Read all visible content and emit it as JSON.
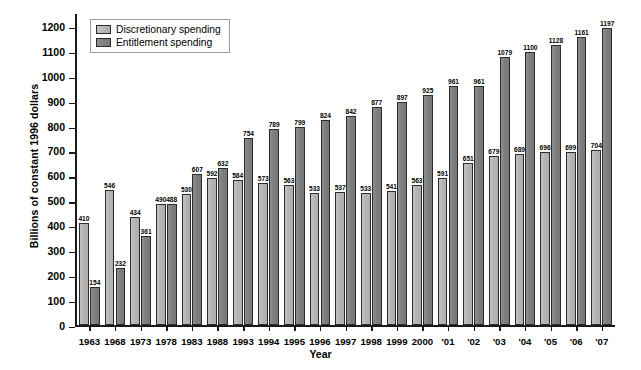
{
  "chart_data": {
    "type": "bar",
    "title": "",
    "xlabel": "Year",
    "ylabel": "Billions of constant 1996 dollars",
    "ylim": [
      0,
      1250
    ],
    "yticks": [
      0,
      100,
      200,
      300,
      400,
      500,
      600,
      700,
      800,
      900,
      1000,
      1100,
      1200
    ],
    "grid": false,
    "legend_position": "top-left",
    "categories": [
      "1963",
      "1968",
      "1973",
      "1978",
      "1983",
      "1988",
      "1993",
      "1994",
      "1995",
      "1996",
      "1997",
      "1998",
      "1999",
      "2000",
      "'01",
      "'02",
      "'03",
      "'04",
      "'05",
      "'06",
      "'07"
    ],
    "series": [
      {
        "name": "Discretionary spending",
        "color": "#b4b4b4",
        "values": [
          410,
          546,
          434,
          490,
          530,
          592,
          584,
          573,
          563,
          533,
          537,
          533,
          541,
          563,
          591,
          651,
          679,
          689,
          696,
          699,
          704
        ]
      },
      {
        "name": "Entitlement spending",
        "color": "#7e7e7e",
        "values": [
          154,
          232,
          361,
          488,
          607,
          632,
          754,
          789,
          799,
          824,
          842,
          877,
          897,
          925,
          961,
          961,
          1079,
          1100,
          1128,
          1161,
          1197
        ]
      }
    ]
  },
  "legend": {
    "items": [
      {
        "label": "Discretionary spending",
        "swatch": "light"
      },
      {
        "label": "Entitlement spending",
        "swatch": "dark"
      }
    ]
  },
  "colors": {
    "discretionary": "#b4b4b4",
    "entitlement": "#7e7e7e",
    "axis": "#1a1a1a",
    "background": "#ffffff"
  }
}
